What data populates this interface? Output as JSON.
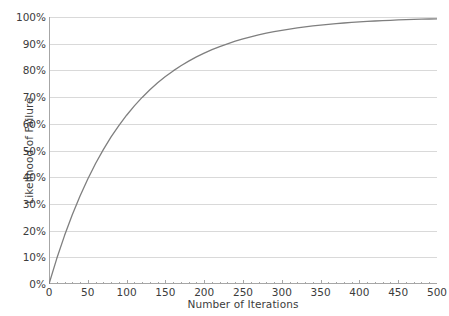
{
  "chart_data": {
    "type": "line",
    "title": "",
    "xlabel": "Number of Iterations",
    "ylabel": "Likelihood of Failure",
    "xlim": [
      0,
      500
    ],
    "ylim": [
      0,
      1
    ],
    "grid": true,
    "grid_axis": "y",
    "legend": false,
    "legend_position": "none",
    "x_ticks": [
      0,
      50,
      100,
      150,
      200,
      250,
      300,
      350,
      400,
      450,
      500
    ],
    "x_tick_labels": [
      "0",
      "50",
      "100",
      "150",
      "200",
      "250",
      "300",
      "350",
      "400",
      "450",
      "500"
    ],
    "y_ticks": [
      0,
      0.1,
      0.2,
      0.3,
      0.4,
      0.5,
      0.6,
      0.7,
      0.8,
      0.9,
      1.0
    ],
    "y_tick_labels": [
      "0%",
      "10%",
      "20%",
      "30%",
      "40%",
      "50%",
      "60%",
      "70%",
      "80%",
      "90%",
      "100%"
    ],
    "y_tick_format": "percent",
    "series": [
      {
        "name": "Likelihood of Failure",
        "color": "#7f7f7f",
        "line_width": 1.3,
        "formula": "1 - exp(-x/100)",
        "x": [
          0,
          10,
          20,
          30,
          40,
          50,
          60,
          70,
          80,
          90,
          100,
          110,
          120,
          130,
          140,
          150,
          160,
          170,
          180,
          190,
          200,
          210,
          220,
          230,
          240,
          250,
          260,
          270,
          280,
          290,
          300,
          310,
          320,
          330,
          340,
          350,
          360,
          370,
          380,
          390,
          400,
          410,
          420,
          430,
          440,
          450,
          460,
          470,
          480,
          490,
          500
        ],
        "values": [
          0.0,
          0.0952,
          0.1813,
          0.2592,
          0.3297,
          0.3935,
          0.4512,
          0.5034,
          0.5507,
          0.5934,
          0.6321,
          0.6671,
          0.6988,
          0.7275,
          0.7534,
          0.7769,
          0.7981,
          0.8173,
          0.8347,
          0.8504,
          0.8647,
          0.8775,
          0.8892,
          0.8997,
          0.9093,
          0.9179,
          0.9257,
          0.9328,
          0.9392,
          0.945,
          0.9502,
          0.955,
          0.9592,
          0.9631,
          0.9666,
          0.9698,
          0.9727,
          0.9753,
          0.9776,
          0.9798,
          0.9817,
          0.9835,
          0.985,
          0.9864,
          0.9877,
          0.9889,
          0.9899,
          0.9909,
          0.9918,
          0.9926,
          0.9933
        ]
      }
    ],
    "colors": {
      "line": "#7f7f7f",
      "grid": "#d9d9d9",
      "axis": "#a6a6a6",
      "background": "#ffffff",
      "text": "#3c3c3c"
    }
  },
  "axes": {
    "x_title": "Number of Iterations",
    "y_title": "Likelihood of Failure"
  }
}
